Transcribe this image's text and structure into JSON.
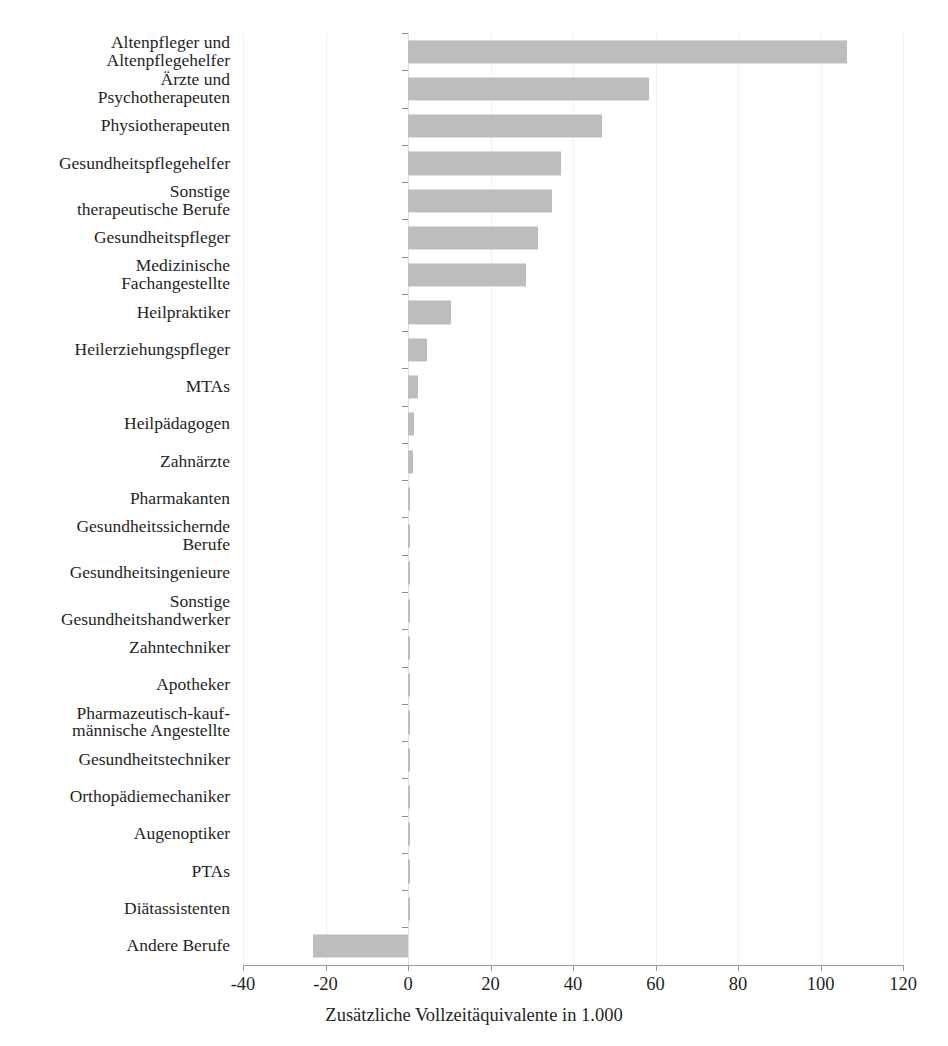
{
  "figure": {
    "clipped_header_text": "",
    "bar_color": "#bdbdbd",
    "grid_color": "#f1f1f1",
    "axis_color": "#9a9a9a"
  },
  "chart_data": {
    "type": "bar",
    "orientation": "horizontal",
    "title": "",
    "xlabel": "Zusätzliche Vollzeitäquivalente in 1.000",
    "ylabel": "",
    "xlim": [
      -40,
      120
    ],
    "xticks": [
      -40,
      -20,
      0,
      20,
      40,
      60,
      80,
      100,
      120
    ],
    "xtick_labels": [
      "-40",
      "-20",
      "0",
      "20",
      "40",
      "60",
      "80",
      "100",
      "120"
    ],
    "grid": true,
    "legend": "none",
    "categories": [
      "Altenpfleger und\nAltenpflegehelfer",
      "Ärzte und\nPsychotherapeuten",
      "Physiotherapeuten",
      "Gesundheitspflegehelfer",
      "Sonstige\ntherapeutische Berufe",
      "Gesundheitspfleger",
      "Medizinische\nFachangestellte",
      "Heilpraktiker",
      "Heilerziehungspfleger",
      "MTAs",
      "Heilpädagogen",
      "Zahnärzte",
      "Pharmakanten",
      "Gesundheitssichernde\nBerufe",
      "Gesundheitsingenieure",
      "Sonstige\nGesundheitshandwerker",
      "Zahntechniker",
      "Apotheker",
      "Pharmazeutisch-kauf-\nmännische Angestellte",
      "Gesundheitstechniker",
      "Orthopädiemechaniker",
      "Augenoptiker",
      "PTAs",
      "Diätassistenten",
      "Andere Berufe"
    ],
    "values": [
      106.5,
      58.5,
      47.0,
      37.0,
      35.0,
      31.5,
      28.5,
      10.5,
      4.5,
      2.5,
      1.5,
      1.2,
      0.6,
      0.5,
      0.4,
      0.4,
      0.3,
      0.3,
      0.2,
      0.2,
      0.2,
      0.15,
      0.1,
      0.1,
      -23.0
    ]
  }
}
